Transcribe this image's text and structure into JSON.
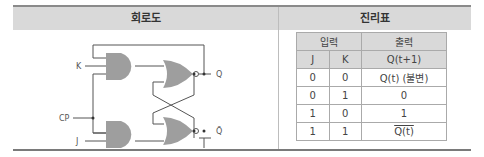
{
  "headers": {
    "circuit": "회로도",
    "truth_table": "진리표"
  },
  "circuit": {
    "labels": {
      "k": "K",
      "cp": "CP",
      "j": "J",
      "q": "Q",
      "q_bar": "Q̄"
    },
    "colors": {
      "gate_fill": "#9e9e9e",
      "wire": "#555555"
    }
  },
  "truth_table": {
    "group_headers": {
      "input": "입력",
      "output": "출력"
    },
    "columns": [
      "J",
      "K",
      "Q(t+1)"
    ],
    "rows": [
      [
        "0",
        "0",
        "Q(t) (불변)"
      ],
      [
        "0",
        "1",
        "0"
      ],
      [
        "1",
        "0",
        "1"
      ],
      [
        "1",
        "1",
        "Q(t)"
      ]
    ],
    "last_row_overline": true
  }
}
